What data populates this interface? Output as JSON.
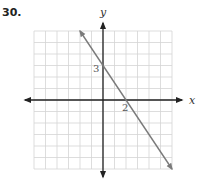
{
  "problem": {
    "number": "30."
  },
  "chart_data": {
    "type": "line",
    "title": "",
    "xlabel": "x",
    "ylabel": "y",
    "xlim": [
      -6,
      6
    ],
    "ylim": [
      -6,
      6
    ],
    "grid": true,
    "grid_step": 1,
    "series": [
      {
        "name": "line",
        "equation": "y = -1.5x + 3",
        "slope": -1.5,
        "y_intercept": 3,
        "x_intercept": 2,
        "x": [
          -2,
          0,
          2,
          6
        ],
        "y": [
          6,
          3,
          0,
          -6
        ],
        "arrows": "both ends"
      }
    ],
    "annotations": [
      {
        "text": "3",
        "x": 0,
        "y": 3,
        "note": "y-intercept label"
      },
      {
        "text": "2",
        "x": 2,
        "y": 0,
        "note": "x-intercept label"
      }
    ]
  },
  "colors": {
    "grid": "#d4d4d4",
    "axes": "#222222",
    "line": "#7a7a7a",
    "labels": "#555555"
  }
}
